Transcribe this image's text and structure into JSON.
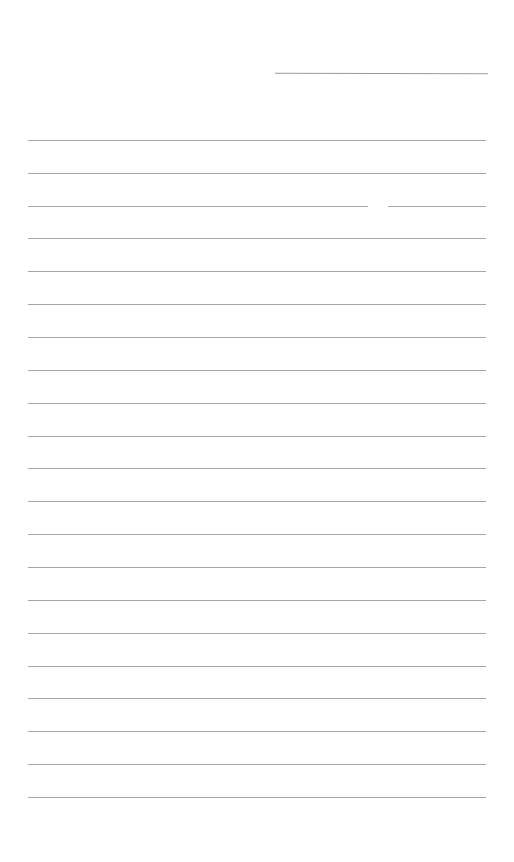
{
  "page": {
    "type": "lined-paper",
    "background_color": "#ffffff",
    "line_color": "#a6a6a6",
    "header_line": {
      "present": true
    },
    "rule_count": 21,
    "rule_positions_y": [
      140,
      173,
      206,
      238,
      271,
      304,
      337,
      370,
      403,
      436,
      468,
      501,
      534,
      567,
      600,
      633,
      666,
      698,
      731,
      764,
      797,
      830
    ]
  }
}
